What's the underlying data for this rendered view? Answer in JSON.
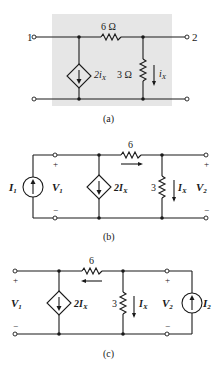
{
  "figure": {
    "panels": [
      {
        "id": "a",
        "caption": "(a)",
        "background_box_color": "#e6e6e6",
        "terminal_left_label": "1",
        "terminal_right_label": "2",
        "series_resistor_label": "6 Ω",
        "shunt_resistor_label": "3 Ω",
        "dependent_source_label": "2i",
        "dependent_source_subscript": "X",
        "current_label": "i",
        "current_subscript": "X"
      },
      {
        "id": "b",
        "caption": "(b)",
        "source_label": "I",
        "source_subscript": "1",
        "v_left": "V",
        "v_left_sub": "1",
        "v_right": "V",
        "v_right_sub": "2",
        "series_resistor_label": "6",
        "shunt_resistor_label": "3",
        "dependent_source_label": "2I",
        "dependent_source_subscript": "X",
        "current_label": "I",
        "current_subscript": "X",
        "plus": "+",
        "minus": "−",
        "series_current_direction": "right"
      },
      {
        "id": "c",
        "caption": "(c)",
        "source_label": "I",
        "source_subscript": "2",
        "v_left": "V",
        "v_left_sub": "1",
        "v_right": "V",
        "v_right_sub": "2",
        "series_resistor_label": "6",
        "shunt_resistor_label": "3",
        "dependent_source_label": "2I",
        "dependent_source_subscript": "X",
        "current_label": "I",
        "current_subscript": "X",
        "plus": "+",
        "minus": "−",
        "series_current_direction": "left"
      }
    ]
  }
}
